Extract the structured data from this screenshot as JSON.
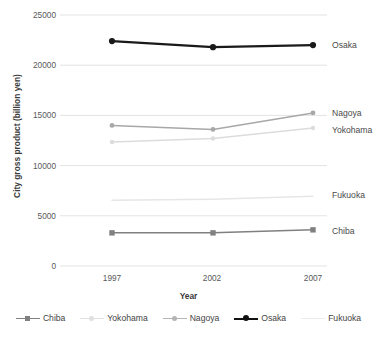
{
  "chart_data": {
    "type": "line",
    "title": "",
    "xlabel": "Year",
    "ylabel": "City gross product (billion yen)",
    "categories": [
      "1997",
      "2002",
      "2007"
    ],
    "x": [
      1997,
      2002,
      2007
    ],
    "ylim": [
      0,
      25000
    ],
    "yticks": [
      "0",
      "5000",
      "10000",
      "15000",
      "20000",
      "25000"
    ],
    "ytick_values": [
      0,
      5000,
      10000,
      15000,
      20000,
      25000
    ],
    "grid": true,
    "legend_position": "bottom",
    "series": [
      {
        "name": "Chiba",
        "values": [
          3300,
          3300,
          3600
        ],
        "color": "#808080",
        "marker": "square",
        "label_y": 231
      },
      {
        "name": "Yokohama",
        "values": [
          12350,
          12700,
          13750
        ],
        "color": "#dcdcdc",
        "marker": "diamond",
        "label_y": 130
      },
      {
        "name": "Nagoya",
        "values": [
          14000,
          13600,
          15250
        ],
        "color": "#a8a8a8",
        "marker": "triangle",
        "label_y": 113
      },
      {
        "name": "Osaka",
        "values": [
          22400,
          21800,
          22000
        ],
        "color": "#1a1a1a",
        "marker": "circle",
        "label_y": 45
      },
      {
        "name": "Fukuoka",
        "values": [
          6550,
          6650,
          6950
        ],
        "color": "#e6e6e6",
        "marker": "none",
        "label_y": 195
      }
    ],
    "annotations": [
      {
        "text": "Osaka",
        "x": 332,
        "y": 45
      },
      {
        "text": "Nagoya",
        "x": 332,
        "y": 113
      },
      {
        "text": "Yokohama",
        "x": 332,
        "y": 130
      },
      {
        "text": "Fukuoka",
        "x": 332,
        "y": 195
      },
      {
        "text": "Chiba",
        "x": 332,
        "y": 231
      }
    ]
  },
  "axes": {
    "y_title": "City gross product (billion yen)",
    "x_title": "Year",
    "y_ticks": [
      "25000",
      "20000",
      "15000",
      "10000",
      "5000",
      "0"
    ],
    "x_ticks": [
      "1997",
      "2002",
      "2007"
    ]
  },
  "legend": {
    "items": [
      {
        "label": "Chiba",
        "color": "#808080",
        "marker": "square"
      },
      {
        "label": "Yokohama",
        "color": "#e0e0e0",
        "marker": "diamond"
      },
      {
        "label": "Nagoya",
        "color": "#b4b4b4",
        "marker": "triangle"
      },
      {
        "label": "Osaka",
        "color": "#111111",
        "marker": "circle"
      },
      {
        "label": "Fukuoka",
        "color": "#ececec",
        "marker": "none"
      }
    ]
  },
  "colors": {
    "gridline": "#e3e3e3",
    "tick_text": "#595959",
    "title_text": "#3a3a3a",
    "background": "#ffffff"
  }
}
